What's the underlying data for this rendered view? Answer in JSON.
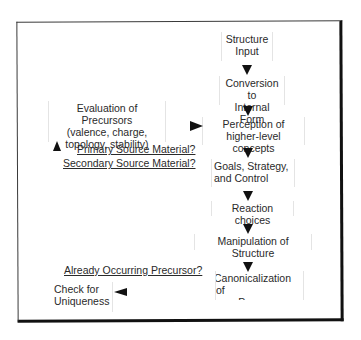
{
  "diagram": {
    "main_flow": [
      {
        "id": "structure-input",
        "label": "Structure\nInput"
      },
      {
        "id": "conversion",
        "label": "Conversion to\nInternal Form"
      },
      {
        "id": "perception",
        "label": "Perception of\nhigher-level concepts"
      },
      {
        "id": "goals",
        "label": "Goals, Strategy,\nand Control"
      },
      {
        "id": "reaction-choices",
        "label": "Reaction choices"
      },
      {
        "id": "manipulation",
        "label": "Manipulation of Structure"
      },
      {
        "id": "canonicalization",
        "label": "Canonicalization of\nnew Precursors"
      }
    ],
    "side_nodes": {
      "evaluation": "Evaluation of Precursors\n(valence, charge,\ntopology, stability)",
      "check_uniqueness": "Check for\nUniqueness"
    },
    "edge_labels": {
      "primary": "Primary Source Material?",
      "secondary": "Secondary Source Material?",
      "already_occurring": "Already Occurring Precursor?"
    },
    "edges": [
      {
        "from": "structure-input",
        "to": "conversion",
        "direction": "down"
      },
      {
        "from": "conversion",
        "to": "perception",
        "direction": "down"
      },
      {
        "from": "perception",
        "to": "goals",
        "direction": "down"
      },
      {
        "from": "goals",
        "to": "reaction-choices",
        "direction": "down"
      },
      {
        "from": "reaction-choices",
        "to": "manipulation",
        "direction": "down"
      },
      {
        "from": "manipulation",
        "to": "canonicalization",
        "direction": "down"
      },
      {
        "from": "canonicalization",
        "to": "check_uniqueness",
        "direction": "left",
        "label": "Already Occurring Precursor?"
      },
      {
        "from": "check_uniqueness",
        "to": "evaluation",
        "direction": "up"
      },
      {
        "from": "evaluation",
        "to": "perception",
        "direction": "right",
        "label": "Primary Source Material? / Secondary Source Material?"
      }
    ]
  }
}
